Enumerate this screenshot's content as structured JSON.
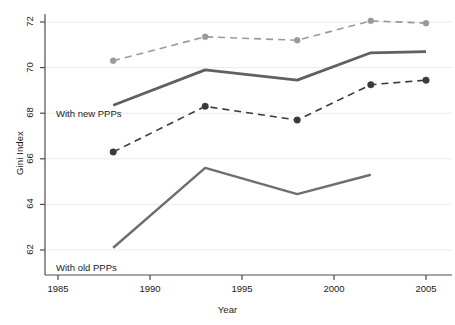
{
  "chart_data": {
    "type": "line",
    "title": "",
    "subtitle": "",
    "xlabel": "Year",
    "ylabel": "Gini Index",
    "xlim": [
      1985,
      2006.2
    ],
    "ylim": [
      61.45,
      72.6
    ],
    "xticks": [
      1985,
      1990,
      1995,
      2000,
      2005
    ],
    "xticklabels": [
      "1985",
      "1990",
      "1995",
      "2000",
      "2005"
    ],
    "yticks": [
      62,
      64,
      66,
      68,
      70,
      72
    ],
    "yticklabels": [
      "62",
      "64",
      "66",
      "68",
      "70",
      "72"
    ],
    "grid": "horizontal-light",
    "legend_position": "inline-annotations",
    "x": [
      1988,
      1993,
      1998,
      2002,
      2005
    ],
    "series": [
      {
        "name": "Upper bound with new PPPs",
        "style": "dashed",
        "color": "#9a9a9a",
        "marker": "circle",
        "marker_size": 6,
        "line_width": 1.6,
        "x": [
          1988,
          1993,
          1998,
          2002,
          2005
        ],
        "values": [
          70.3,
          71.35,
          71.2,
          72.05,
          71.95
        ]
      },
      {
        "name": "With new PPPs",
        "style": "solid",
        "color": "#606060",
        "marker": "none",
        "marker_size": 0,
        "line_width": 2.8,
        "x": [
          1988,
          1993,
          1998,
          2002,
          2005
        ],
        "values": [
          68.35,
          69.9,
          69.45,
          70.65,
          70.7
        ]
      },
      {
        "name": "Lower bound with new PPPs",
        "style": "dashed",
        "color": "#3a3a3a",
        "marker": "circle",
        "marker_size": 6.5,
        "line_width": 1.6,
        "x": [
          1988,
          1993,
          1998,
          2002,
          2005
        ],
        "values": [
          66.3,
          68.3,
          67.7,
          69.25,
          69.45
        ]
      },
      {
        "name": "With old PPPs",
        "style": "solid",
        "color": "#6e6e6e",
        "marker": "none",
        "marker_size": 0,
        "line_width": 2.4,
        "x": [
          1988,
          1993,
          1998,
          2002
        ],
        "values": [
          62.1,
          65.6,
          64.45,
          65.3
        ]
      }
    ],
    "annotations": [
      {
        "text": "With new PPPs",
        "x_px": 56,
        "y_px": 108
      },
      {
        "text": "With old PPPs",
        "x_px": 56,
        "y_px": 262
      }
    ]
  },
  "colors": {
    "background": "#ffffff",
    "axis": "#4d4d4d",
    "grid": "#ebebeb",
    "text": "#1a1a1a",
    "series_upper": "#9a9a9a",
    "series_mid": "#606060",
    "series_lower": "#3a3a3a",
    "series_old": "#6e6e6e"
  }
}
